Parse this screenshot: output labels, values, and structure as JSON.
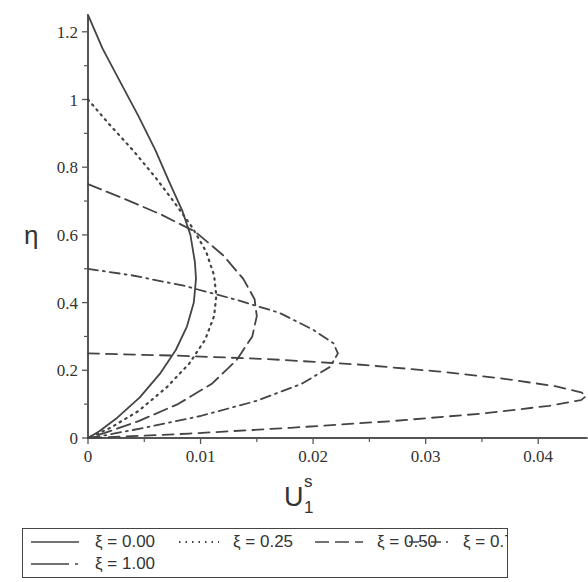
{
  "chart_data": {
    "type": "line",
    "title": "",
    "xlabel": "U_1^s",
    "xlabel_main": "U",
    "xlabel_sup": "s",
    "xlabel_sub": "1",
    "ylabel": "η",
    "xlim": [
      0,
      0.0443
    ],
    "ylim": [
      0,
      1.25
    ],
    "x_ticks": [
      0,
      0.01,
      0.02,
      0.03,
      0.04
    ],
    "x_tick_labels": [
      "0",
      "0.01",
      "0.02",
      "0.03",
      "0.04"
    ],
    "y_ticks": [
      0,
      0.2,
      0.4,
      0.6,
      0.8,
      1.0,
      1.2
    ],
    "y_tick_labels": [
      "0",
      "0.2",
      "0.4",
      "0.6",
      "0.8",
      "1",
      "1.2"
    ],
    "grid": false,
    "legend_position": "bottom",
    "series": [
      {
        "name": "ξ = 0.00",
        "style": "solid",
        "points": [
          [
            0,
            1.25
          ],
          [
            0.0013,
            1.15
          ],
          [
            0.0029,
            1.05
          ],
          [
            0.0045,
            0.95
          ],
          [
            0.006,
            0.85
          ],
          [
            0.0073,
            0.75
          ],
          [
            0.0084,
            0.67
          ],
          [
            0.0091,
            0.6
          ],
          [
            0.0095,
            0.52
          ],
          [
            0.0096,
            0.47
          ],
          [
            0.0094,
            0.4
          ],
          [
            0.0088,
            0.33
          ],
          [
            0.0078,
            0.26
          ],
          [
            0.0064,
            0.19
          ],
          [
            0.0046,
            0.12
          ],
          [
            0.0026,
            0.06
          ],
          [
            0.001,
            0.02
          ],
          [
            0,
            0
          ]
        ]
      },
      {
        "name": "ξ = 0.25",
        "style": "dotted",
        "points": [
          [
            0,
            1.0
          ],
          [
            0.0018,
            0.93
          ],
          [
            0.004,
            0.85
          ],
          [
            0.006,
            0.77
          ],
          [
            0.0078,
            0.69
          ],
          [
            0.0093,
            0.62
          ],
          [
            0.0105,
            0.55
          ],
          [
            0.0112,
            0.48
          ],
          [
            0.0114,
            0.42
          ],
          [
            0.0112,
            0.36
          ],
          [
            0.0104,
            0.29
          ],
          [
            0.009,
            0.22
          ],
          [
            0.007,
            0.15
          ],
          [
            0.0045,
            0.08
          ],
          [
            0.002,
            0.03
          ],
          [
            0,
            0
          ]
        ]
      },
      {
        "name": "ξ = 0.50",
        "style": "longdash",
        "points": [
          [
            0,
            0.75
          ],
          [
            0.003,
            0.71
          ],
          [
            0.0065,
            0.66
          ],
          [
            0.0095,
            0.61
          ],
          [
            0.012,
            0.54
          ],
          [
            0.0138,
            0.47
          ],
          [
            0.0148,
            0.41
          ],
          [
            0.015,
            0.36
          ],
          [
            0.0146,
            0.3
          ],
          [
            0.0132,
            0.23
          ],
          [
            0.011,
            0.16
          ],
          [
            0.008,
            0.1
          ],
          [
            0.0045,
            0.05
          ],
          [
            0.0015,
            0.015
          ],
          [
            0,
            0
          ]
        ]
      },
      {
        "name": "ξ = 0.75",
        "style": "dashdot",
        "points": [
          [
            0,
            0.5
          ],
          [
            0.004,
            0.48
          ],
          [
            0.0085,
            0.45
          ],
          [
            0.013,
            0.41
          ],
          [
            0.017,
            0.37
          ],
          [
            0.02,
            0.32
          ],
          [
            0.0218,
            0.28
          ],
          [
            0.0222,
            0.25
          ],
          [
            0.0215,
            0.21
          ],
          [
            0.019,
            0.16
          ],
          [
            0.015,
            0.11
          ],
          [
            0.01,
            0.065
          ],
          [
            0.005,
            0.03
          ],
          [
            0.0015,
            0.008
          ],
          [
            0,
            0
          ]
        ]
      },
      {
        "name": "ξ = 1.00",
        "style": "dash",
        "points": [
          [
            0,
            0.25
          ],
          [
            0.008,
            0.243
          ],
          [
            0.016,
            0.233
          ],
          [
            0.024,
            0.217
          ],
          [
            0.031,
            0.197
          ],
          [
            0.037,
            0.175
          ],
          [
            0.0415,
            0.153
          ],
          [
            0.0438,
            0.135
          ],
          [
            0.0443,
            0.125
          ],
          [
            0.0438,
            0.112
          ],
          [
            0.041,
            0.095
          ],
          [
            0.035,
            0.072
          ],
          [
            0.027,
            0.05
          ],
          [
            0.018,
            0.03
          ],
          [
            0.009,
            0.013
          ],
          [
            0.003,
            0.004
          ],
          [
            0,
            0
          ]
        ]
      }
    ]
  },
  "legend": {
    "items": [
      {
        "label": "ξ = 0.00",
        "style": "solid"
      },
      {
        "label": "ξ = 0.25",
        "style": "dotted"
      },
      {
        "label": "ξ = 0.50",
        "style": "longdash"
      },
      {
        "label": "ξ = 0.75",
        "style": "dashdot"
      },
      {
        "label": "ξ = 1.00",
        "style": "dash"
      }
    ]
  },
  "colors": {
    "line": "#444444",
    "axis": "#555555",
    "text": "#333333"
  }
}
